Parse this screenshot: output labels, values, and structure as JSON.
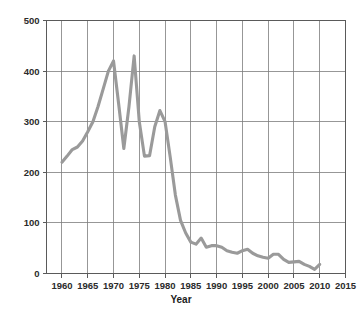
{
  "chart_data": {
    "type": "line",
    "title": "",
    "xlabel": "Year",
    "ylabel": "",
    "xlim": [
      1957,
      2015
    ],
    "ylim": [
      0,
      500
    ],
    "grid": true,
    "legend": false,
    "line_color": "#9a9a9a",
    "grid_color": "#7d7d7d",
    "axis_color": "#5a5a5a",
    "x_ticks": [
      1960,
      1965,
      1970,
      1975,
      1980,
      1985,
      1990,
      1995,
      2000,
      2005,
      2010,
      2015
    ],
    "y_ticks": [
      0,
      100,
      200,
      300,
      400,
      500
    ],
    "series": [
      {
        "name": "value",
        "x": [
          1960,
          1961,
          1962,
          1963,
          1964,
          1965,
          1966,
          1967,
          1968,
          1969,
          1970,
          1971,
          1972,
          1973,
          1974,
          1975,
          1976,
          1977,
          1978,
          1979,
          1980,
          1981,
          1982,
          1983,
          1984,
          1985,
          1986,
          1987,
          1988,
          1989,
          1990,
          1991,
          1992,
          1993,
          1994,
          1995,
          1996,
          1997,
          1998,
          1999,
          2000,
          2001,
          2002,
          2003,
          2004,
          2005,
          2006,
          2007,
          2008,
          2009,
          2010
        ],
        "values": [
          220,
          232,
          245,
          250,
          262,
          280,
          300,
          330,
          365,
          400,
          420,
          335,
          247,
          330,
          430,
          300,
          232,
          233,
          290,
          322,
          300,
          230,
          155,
          105,
          80,
          62,
          58,
          70,
          52,
          55,
          55,
          52,
          45,
          42,
          40,
          45,
          48,
          40,
          35,
          32,
          30,
          38,
          38,
          28,
          22,
          23,
          24,
          18,
          14,
          8,
          18
        ]
      }
    ]
  },
  "axis": {
    "x_title": "Year",
    "x_tick_labels": [
      "1960",
      "1965",
      "1970",
      "1975",
      "1980",
      "1985",
      "1990",
      "1995",
      "2000",
      "2005",
      "2010",
      "2015"
    ],
    "y_tick_labels": [
      "500",
      "400",
      "300",
      "200",
      "100",
      "0"
    ]
  }
}
